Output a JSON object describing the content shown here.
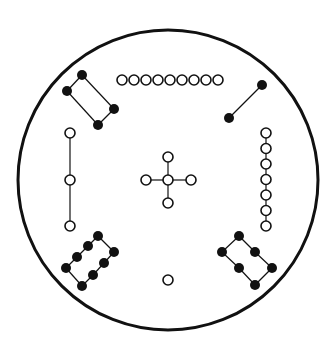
{
  "diagram": {
    "type": "lo-shu-dot-diagram",
    "colors": {
      "ink": "#111111",
      "background": "#ffffff"
    },
    "frame": {
      "cx": 168,
      "cy": 180,
      "r": 150
    },
    "dot_radius": 5,
    "groups": [
      {
        "name": "group-4-black-top-left",
        "count": 4,
        "kind": "yin",
        "dots": [
          [
            82,
            75
          ],
          [
            67,
            91
          ],
          [
            98,
            125
          ],
          [
            114,
            109
          ]
        ],
        "lines": [
          [
            0,
            1
          ],
          [
            1,
            2
          ],
          [
            2,
            3
          ],
          [
            3,
            0
          ]
        ]
      },
      {
        "name": "group-9-white-top",
        "count": 9,
        "kind": "yang",
        "dots": [
          [
            122,
            80
          ],
          [
            134,
            80
          ],
          [
            146,
            80
          ],
          [
            158,
            80
          ],
          [
            170,
            80
          ],
          [
            182,
            80
          ],
          [
            194,
            80
          ],
          [
            206,
            80
          ],
          [
            218,
            80
          ]
        ],
        "lines": []
      },
      {
        "name": "group-2-black-top-right",
        "count": 2,
        "kind": "yin",
        "dots": [
          [
            262,
            85
          ],
          [
            229,
            118
          ]
        ],
        "lines": [
          [
            0,
            1
          ]
        ]
      },
      {
        "name": "group-3-white-left",
        "count": 3,
        "kind": "yang",
        "dots": [
          [
            70,
            133
          ],
          [
            70,
            180
          ],
          [
            70,
            226
          ]
        ],
        "lines": [
          [
            0,
            1
          ],
          [
            1,
            2
          ]
        ]
      },
      {
        "name": "group-5-white-center",
        "count": 5,
        "kind": "yang",
        "dots": [
          [
            168,
            180
          ],
          [
            168,
            157
          ],
          [
            168,
            203
          ],
          [
            146,
            180
          ],
          [
            191,
            180
          ]
        ],
        "lines": [
          [
            0,
            1
          ],
          [
            0,
            2
          ],
          [
            0,
            3
          ],
          [
            0,
            4
          ]
        ]
      },
      {
        "name": "group-7-white-right",
        "count": 7,
        "kind": "yang",
        "dots": [
          [
            266,
            133
          ],
          [
            266,
            148.5
          ],
          [
            266,
            164
          ],
          [
            266,
            179.5
          ],
          [
            266,
            195
          ],
          [
            266,
            210.5
          ],
          [
            266,
            226
          ]
        ],
        "lines": [
          [
            0,
            1
          ],
          [
            1,
            2
          ],
          [
            2,
            3
          ],
          [
            3,
            4
          ],
          [
            4,
            5
          ],
          [
            5,
            6
          ]
        ]
      },
      {
        "name": "group-8-black-bottom-left",
        "count": 8,
        "kind": "yin",
        "dots": [
          [
            98,
            236
          ],
          [
            88,
            246
          ],
          [
            77,
            257
          ],
          [
            66,
            268
          ],
          [
            114,
            252
          ],
          [
            104,
            263
          ],
          [
            93,
            275
          ],
          [
            82,
            286
          ]
        ],
        "lines": [
          [
            0,
            1
          ],
          [
            1,
            2
          ],
          [
            2,
            3
          ],
          [
            4,
            5
          ],
          [
            5,
            6
          ],
          [
            6,
            7
          ],
          [
            0,
            4
          ],
          [
            3,
            7
          ]
        ]
      },
      {
        "name": "group-1-white-bottom",
        "count": 1,
        "kind": "yang",
        "dots": [
          [
            168,
            280
          ]
        ],
        "lines": []
      },
      {
        "name": "group-6-black-bottom-right",
        "count": 6,
        "kind": "yin",
        "dots": [
          [
            239,
            236
          ],
          [
            222,
            252
          ],
          [
            255,
            252
          ],
          [
            239,
            268
          ],
          [
            272,
            268
          ],
          [
            255,
            285
          ]
        ],
        "lines": [
          [
            0,
            1
          ],
          [
            1,
            3
          ],
          [
            3,
            5
          ],
          [
            0,
            2
          ],
          [
            2,
            4
          ],
          [
            4,
            5
          ]
        ]
      }
    ]
  }
}
